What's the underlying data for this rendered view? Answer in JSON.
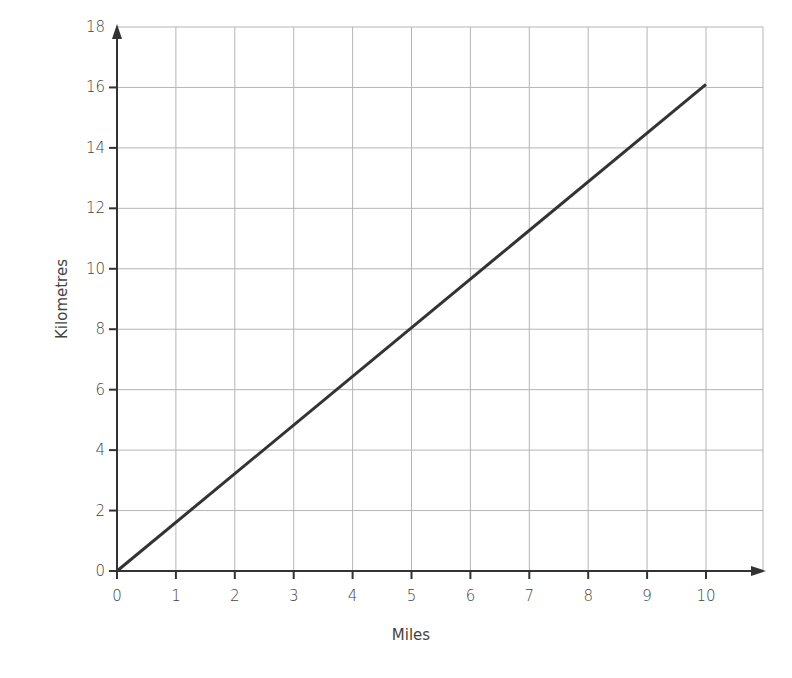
{
  "chart_data": {
    "type": "line",
    "title": "",
    "xlabel": "Miles",
    "ylabel": "Kilometres",
    "xlim": [
      0,
      10.95
    ],
    "ylim": [
      0,
      18
    ],
    "xticks": [
      0,
      1,
      2,
      3,
      4,
      5,
      6,
      7,
      8,
      9,
      10
    ],
    "yticks": [
      0,
      2,
      4,
      6,
      8,
      10,
      12,
      14,
      16,
      18
    ],
    "grid": true,
    "legend": null,
    "series": [
      {
        "name": "Miles to Kilometres",
        "color": "#333333",
        "x": [
          0,
          10
        ],
        "y": [
          0,
          16.1
        ]
      }
    ]
  },
  "layout": {
    "plot": {
      "x0": 117,
      "x1": 706,
      "xunits": 10,
      "y0": 571,
      "ytop": 27,
      "yunits": 18,
      "gridRight": 763
    },
    "colors": {
      "grid": "#b5b5b5",
      "axis": "#333333",
      "text": "#444444"
    }
  }
}
